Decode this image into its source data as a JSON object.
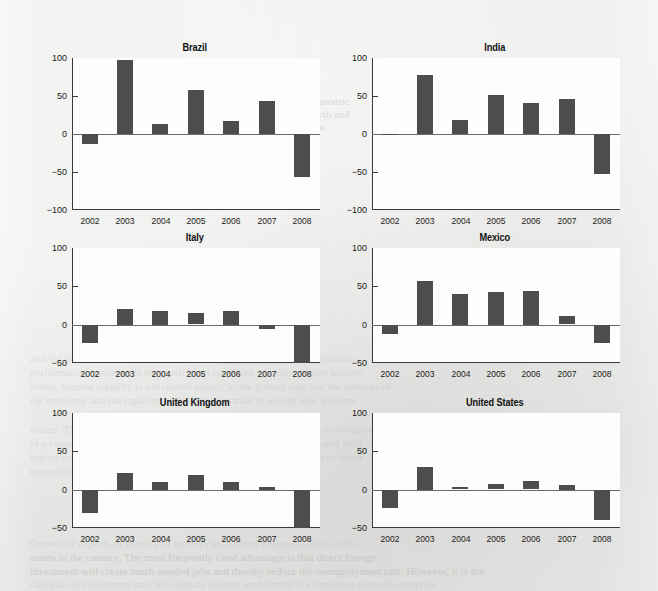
{
  "page": {
    "background_color": "#eaeae8",
    "bar_color": "#4d4d4d",
    "axis_color": "#3a3a3a",
    "bleed_text": [
      {
        "text": "Economic",
        "x": 305,
        "y": 95,
        "size": 11,
        "style": "ghost"
      },
      {
        "text": "growth and",
        "x": 300,
        "y": 108,
        "size": 11,
        "style": "ghost"
      },
      {
        "text": "trade",
        "x": 303,
        "y": 121,
        "size": 11,
        "style": "ghost"
      },
      {
        "text": "Performance",
        "x": 160,
        "y": 176,
        "size": 10,
        "style": "faint"
      },
      {
        "text": "of Brazil",
        "x": 168,
        "y": 188,
        "size": 10,
        "style": "faint"
      },
      {
        "text": "and the private sector in terms of economic growth. Very strong economic",
        "x": 30,
        "y": 352,
        "size": 11,
        "style": "faint"
      },
      {
        "text": "performance, however, is not a sufficient condition to ensure higher income",
        "x": 30,
        "y": 366,
        "size": 11,
        "style": "faint"
      },
      {
        "text": "levels. Income equality is not related simply to the growth rate, but the services of",
        "x": 30,
        "y": 380,
        "size": 11,
        "style": "faint"
      },
      {
        "text": "the economy and the capacity of the labour market to absorb new workers",
        "x": 30,
        "y": 394,
        "size": 11,
        "style": "faint"
      },
      {
        "text": "matter. The structure of output is also a determinant of the income distribution",
        "x": 30,
        "y": 423,
        "size": 11,
        "style": "faint"
      },
      {
        "text": "of a country. A high share of agriculture in GDP tends to be associated with",
        "x": 30,
        "y": 437,
        "size": 11,
        "style": "faint"
      },
      {
        "text": "higher income inequality, while a higher share of services is linked to lower",
        "x": 30,
        "y": 451,
        "size": 11,
        "style": "faint"
      },
      {
        "text": "inequality in the distribution of income.",
        "x": 30,
        "y": 465,
        "size": 11,
        "style": "faint"
      },
      {
        "text": "Growth of exports of goods and services in selected countries, 2002-2008",
        "x": 30,
        "y": 537,
        "size": 11,
        "style": "faint"
      },
      {
        "text": "assets in the country. The most frequently cited advantage is that direct foreign",
        "x": 30,
        "y": 551,
        "size": 11,
        "style": "ghost"
      },
      {
        "text": "investment will create much-needed jobs and thereby reduce the unemployment rate. However, it is the",
        "x": 30,
        "y": 565,
        "size": 11,
        "style": "ghost"
      },
      {
        "text": "case that such investment may also displace existing employment in a competing domestic enterprise.",
        "x": 30,
        "y": 579,
        "size": 10,
        "style": "faint"
      }
    ]
  },
  "chart_data": [
    {
      "type": "bar",
      "title": "Brazil",
      "xlabel": "",
      "ylabel": "",
      "categories": [
        "2002",
        "2003",
        "2004",
        "2005",
        "2006",
        "2007",
        "2008"
      ],
      "values": [
        -13,
        97,
        13,
        58,
        17,
        44,
        -57
      ],
      "ylim": [
        -100,
        100
      ],
      "yticks": [
        100,
        50,
        0,
        -50,
        -100
      ],
      "ytick_labels": [
        "100",
        "50",
        "0",
        "−50",
        "−100"
      ],
      "grid": false,
      "legend": "none"
    },
    {
      "type": "bar",
      "title": "India",
      "xlabel": "",
      "ylabel": "",
      "categories": [
        "2002",
        "2003",
        "2004",
        "2005",
        "2006",
        "2007",
        "2008"
      ],
      "values": [
        -1,
        78,
        18,
        51,
        41,
        46,
        -52
      ],
      "ylim": [
        -100,
        100
      ],
      "yticks": [
        100,
        50,
        0,
        -50,
        -100
      ],
      "ytick_labels": [
        "100",
        "50",
        "0",
        "−50",
        "−100"
      ],
      "grid": false,
      "legend": "none"
    },
    {
      "type": "bar",
      "title": "Italy",
      "xlabel": "",
      "ylabel": "",
      "categories": [
        "2002",
        "2003",
        "2004",
        "2005",
        "2006",
        "2007",
        "2008"
      ],
      "values": [
        -24,
        21,
        18,
        15,
        18,
        -5,
        -49
      ],
      "ylim": [
        -50,
        100
      ],
      "yticks": [
        100,
        50,
        0,
        -50
      ],
      "ytick_labels": [
        "100",
        "50",
        "0",
        "−50"
      ],
      "grid": false,
      "legend": "none"
    },
    {
      "type": "bar",
      "title": "Mexico",
      "xlabel": "",
      "ylabel": "",
      "categories": [
        "2002",
        "2003",
        "2004",
        "2005",
        "2006",
        "2007",
        "2008"
      ],
      "values": [
        -12,
        57,
        40,
        43,
        44,
        11,
        -24
      ],
      "ylim": [
        -50,
        100
      ],
      "yticks": [
        100,
        50,
        0,
        -50
      ],
      "ytick_labels": [
        "100",
        "50",
        "0",
        "−50"
      ],
      "grid": false,
      "legend": "none"
    },
    {
      "type": "bar",
      "title": "United Kingdom",
      "xlabel": "",
      "ylabel": "",
      "categories": [
        "2002",
        "2003",
        "2004",
        "2005",
        "2006",
        "2007",
        "2008"
      ],
      "values": [
        -30,
        22,
        10,
        19,
        10,
        4,
        -50
      ],
      "ylim": [
        -50,
        100
      ],
      "yticks": [
        100,
        50,
        0,
        -50
      ],
      "ytick_labels": [
        "100",
        "50",
        "0",
        "−50"
      ],
      "grid": false,
      "legend": "none"
    },
    {
      "type": "bar",
      "title": "United States",
      "xlabel": "",
      "ylabel": "",
      "categories": [
        "2002",
        "2003",
        "2004",
        "2005",
        "2006",
        "2007",
        "2008"
      ],
      "values": [
        -23,
        30,
        3,
        7,
        11,
        6,
        -39
      ],
      "ylim": [
        -50,
        100
      ],
      "yticks": [
        100,
        50,
        0,
        -50
      ],
      "ytick_labels": [
        "100",
        "50",
        "0",
        "−50"
      ],
      "grid": false,
      "legend": "none"
    }
  ],
  "layout": {
    "panels": [
      {
        "left": 40,
        "top": 42,
        "plot_x": 32,
        "plot_y": 16,
        "plot_w": 248,
        "plot_h": 152
      },
      {
        "left": 340,
        "top": 42,
        "plot_x": 32,
        "plot_y": 16,
        "plot_w": 248,
        "plot_h": 152
      },
      {
        "left": 40,
        "top": 232,
        "plot_x": 32,
        "plot_y": 16,
        "plot_w": 248,
        "plot_h": 115
      },
      {
        "left": 340,
        "top": 232,
        "plot_x": 32,
        "plot_y": 16,
        "plot_w": 248,
        "plot_h": 115
      },
      {
        "left": 40,
        "top": 397,
        "plot_x": 32,
        "plot_y": 16,
        "plot_w": 248,
        "plot_h": 115
      },
      {
        "left": 340,
        "top": 397,
        "plot_x": 32,
        "plot_y": 16,
        "plot_w": 248,
        "plot_h": 115
      }
    ],
    "bar_width_ratio": 0.46
  }
}
